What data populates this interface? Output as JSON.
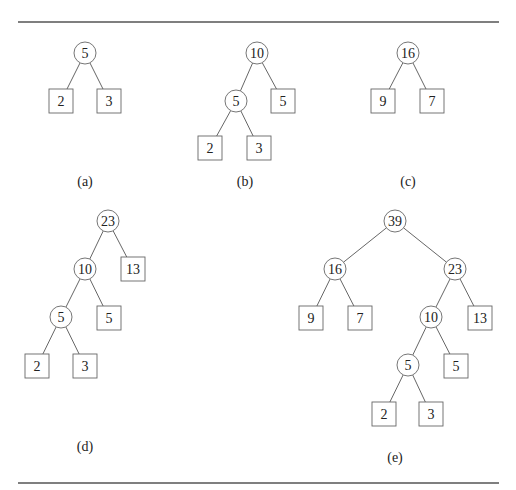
{
  "rules": [
    {
      "x1": 18,
      "x2": 499,
      "y": 22
    },
    {
      "x1": 18,
      "x2": 499,
      "y": 483
    }
  ],
  "node_style": {
    "circle_radius": 11,
    "square_size": 24
  },
  "trees": [
    {
      "id": "a",
      "caption": "(a)",
      "caption_pos": [
        85,
        181
      ],
      "nodes": [
        {
          "id": "a-root",
          "label": "5",
          "shape": "circle",
          "x": 85,
          "y": 53
        },
        {
          "id": "a-l",
          "label": "2",
          "shape": "square",
          "x": 61,
          "y": 101
        },
        {
          "id": "a-r",
          "label": "3",
          "shape": "square",
          "x": 109,
          "y": 101
        }
      ],
      "edges": [
        [
          "a-root",
          "a-l"
        ],
        [
          "a-root",
          "a-r"
        ]
      ]
    },
    {
      "id": "b",
      "caption": "(b)",
      "caption_pos": [
        245,
        181
      ],
      "nodes": [
        {
          "id": "b-root",
          "label": "10",
          "shape": "circle",
          "x": 257,
          "y": 53
        },
        {
          "id": "b-l",
          "label": "5",
          "shape": "circle",
          "x": 236,
          "y": 101
        },
        {
          "id": "b-r",
          "label": "5",
          "shape": "square",
          "x": 283,
          "y": 101
        },
        {
          "id": "b-ll",
          "label": "2",
          "shape": "square",
          "x": 210,
          "y": 148
        },
        {
          "id": "b-lr",
          "label": "3",
          "shape": "square",
          "x": 259,
          "y": 148
        }
      ],
      "edges": [
        [
          "b-root",
          "b-l"
        ],
        [
          "b-root",
          "b-r"
        ],
        [
          "b-l",
          "b-ll"
        ],
        [
          "b-l",
          "b-lr"
        ]
      ]
    },
    {
      "id": "c",
      "caption": "(c)",
      "caption_pos": [
        408,
        181
      ],
      "nodes": [
        {
          "id": "c-root",
          "label": "16",
          "shape": "circle",
          "x": 408,
          "y": 53
        },
        {
          "id": "c-l",
          "label": "9",
          "shape": "square",
          "x": 383,
          "y": 101
        },
        {
          "id": "c-r",
          "label": "7",
          "shape": "square",
          "x": 432,
          "y": 101
        }
      ],
      "edges": [
        [
          "c-root",
          "c-l"
        ],
        [
          "c-root",
          "c-r"
        ]
      ]
    },
    {
      "id": "d",
      "caption": "(d)",
      "caption_pos": [
        85,
        446
      ],
      "nodes": [
        {
          "id": "d-root",
          "label": "23",
          "shape": "circle",
          "x": 108,
          "y": 221
        },
        {
          "id": "d-l",
          "label": "10",
          "shape": "circle",
          "x": 85,
          "y": 269
        },
        {
          "id": "d-r",
          "label": "13",
          "shape": "square",
          "x": 133,
          "y": 269
        },
        {
          "id": "d-ll",
          "label": "5",
          "shape": "circle",
          "x": 61,
          "y": 317
        },
        {
          "id": "d-lr",
          "label": "5",
          "shape": "square",
          "x": 109,
          "y": 318
        },
        {
          "id": "d-lll",
          "label": "2",
          "shape": "square",
          "x": 37,
          "y": 366
        },
        {
          "id": "d-llr",
          "label": "3",
          "shape": "square",
          "x": 85,
          "y": 366
        }
      ],
      "edges": [
        [
          "d-root",
          "d-l"
        ],
        [
          "d-root",
          "d-r"
        ],
        [
          "d-l",
          "d-ll"
        ],
        [
          "d-l",
          "d-lr"
        ],
        [
          "d-ll",
          "d-lll"
        ],
        [
          "d-ll",
          "d-llr"
        ]
      ]
    },
    {
      "id": "e",
      "caption": "(e)",
      "caption_pos": [
        395,
        457
      ],
      "nodes": [
        {
          "id": "e-root",
          "label": "39",
          "shape": "circle",
          "x": 395,
          "y": 221
        },
        {
          "id": "e-l",
          "label": "16",
          "shape": "circle",
          "x": 335,
          "y": 269
        },
        {
          "id": "e-r",
          "label": "23",
          "shape": "circle",
          "x": 455,
          "y": 269
        },
        {
          "id": "e-ll",
          "label": "9",
          "shape": "square",
          "x": 311,
          "y": 318
        },
        {
          "id": "e-lr",
          "label": "7",
          "shape": "square",
          "x": 360,
          "y": 318
        },
        {
          "id": "e-rl",
          "label": "10",
          "shape": "circle",
          "x": 431,
          "y": 317
        },
        {
          "id": "e-rr",
          "label": "13",
          "shape": "square",
          "x": 480,
          "y": 318
        },
        {
          "id": "e-rll",
          "label": "5",
          "shape": "circle",
          "x": 408,
          "y": 365
        },
        {
          "id": "e-rlr",
          "label": "5",
          "shape": "square",
          "x": 456,
          "y": 366
        },
        {
          "id": "e-rlll",
          "label": "2",
          "shape": "square",
          "x": 384,
          "y": 414
        },
        {
          "id": "e-rllr",
          "label": "3",
          "shape": "square",
          "x": 431,
          "y": 414
        }
      ],
      "edges": [
        [
          "e-root",
          "e-l"
        ],
        [
          "e-root",
          "e-r"
        ],
        [
          "e-l",
          "e-ll"
        ],
        [
          "e-l",
          "e-lr"
        ],
        [
          "e-r",
          "e-rl"
        ],
        [
          "e-r",
          "e-rr"
        ],
        [
          "e-rl",
          "e-rll"
        ],
        [
          "e-rl",
          "e-rlr"
        ],
        [
          "e-rll",
          "e-rlll"
        ],
        [
          "e-rll",
          "e-rllr"
        ]
      ]
    }
  ]
}
